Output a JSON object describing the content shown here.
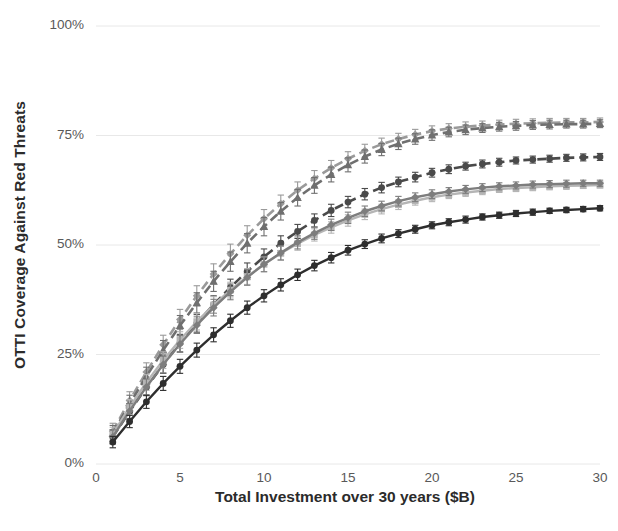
{
  "chart_data": {
    "type": "line",
    "title": "",
    "subtitle": "",
    "xlabel": "Total Investment over 30 years ($B)",
    "ylabel": "OTTI Coverage Against Red Threats",
    "xlim": [
      0,
      30
    ],
    "ylim": [
      0,
      1.0
    ],
    "xticks": [
      0,
      5,
      10,
      15,
      20,
      25,
      30
    ],
    "xtick_labels": [
      "0",
      "5",
      "10",
      "15",
      "20",
      "25",
      "30"
    ],
    "yticks": [
      0,
      0.25,
      0.5,
      0.75,
      1.0
    ],
    "ytick_labels": [
      "0%",
      "25%",
      "50%",
      "75%",
      "100%"
    ],
    "grid": "horizontal",
    "legend": "none",
    "error_bars": true,
    "x": [
      1,
      2,
      3,
      4,
      5,
      6,
      7,
      8,
      9,
      10,
      11,
      12,
      13,
      14,
      15,
      16,
      17,
      18,
      19,
      20,
      21,
      22,
      23,
      24,
      25,
      26,
      27,
      28,
      29,
      30
    ],
    "series": [
      {
        "name": "series-1",
        "color": "#9a9a9a",
        "style": "dashed",
        "marker": "diamond",
        "values": [
          0.075,
          0.145,
          0.21,
          0.272,
          0.33,
          0.384,
          0.434,
          0.48,
          0.522,
          0.56,
          0.594,
          0.625,
          0.652,
          0.676,
          0.697,
          0.715,
          0.73,
          0.742,
          0.752,
          0.76,
          0.766,
          0.77,
          0.773,
          0.775,
          0.777,
          0.778,
          0.779,
          0.78,
          0.78,
          0.781
        ],
        "err": [
          0.018,
          0.02,
          0.021,
          0.022,
          0.023,
          0.023,
          0.023,
          0.022,
          0.022,
          0.021,
          0.02,
          0.019,
          0.018,
          0.017,
          0.016,
          0.015,
          0.014,
          0.013,
          0.012,
          0.012,
          0.011,
          0.011,
          0.01,
          0.01,
          0.01,
          0.01,
          0.01,
          0.009,
          0.009,
          0.009
        ]
      },
      {
        "name": "series-2",
        "color": "#6f6f6f",
        "style": "dashed",
        "marker": "triangle",
        "values": [
          0.07,
          0.137,
          0.2,
          0.26,
          0.316,
          0.368,
          0.417,
          0.462,
          0.504,
          0.542,
          0.577,
          0.608,
          0.636,
          0.661,
          0.683,
          0.702,
          0.718,
          0.731,
          0.742,
          0.751,
          0.758,
          0.763,
          0.767,
          0.77,
          0.772,
          0.774,
          0.775,
          0.776,
          0.776,
          0.777
        ],
        "err": [
          0.018,
          0.02,
          0.021,
          0.022,
          0.023,
          0.023,
          0.023,
          0.022,
          0.022,
          0.021,
          0.02,
          0.019,
          0.018,
          0.017,
          0.016,
          0.015,
          0.014,
          0.013,
          0.012,
          0.012,
          0.011,
          0.011,
          0.01,
          0.01,
          0.01,
          0.01,
          0.01,
          0.009,
          0.009,
          0.009
        ]
      },
      {
        "name": "series-3",
        "color": "#4a4a4a",
        "style": "dashed",
        "marker": "circle",
        "values": [
          0.062,
          0.12,
          0.175,
          0.227,
          0.276,
          0.321,
          0.364,
          0.403,
          0.44,
          0.473,
          0.504,
          0.531,
          0.556,
          0.579,
          0.598,
          0.616,
          0.631,
          0.644,
          0.655,
          0.665,
          0.673,
          0.68,
          0.685,
          0.689,
          0.693,
          0.695,
          0.697,
          0.699,
          0.7,
          0.701
        ],
        "err": [
          0.016,
          0.018,
          0.019,
          0.02,
          0.02,
          0.02,
          0.02,
          0.019,
          0.019,
          0.018,
          0.017,
          0.016,
          0.015,
          0.014,
          0.013,
          0.013,
          0.012,
          0.011,
          0.011,
          0.01,
          0.01,
          0.009,
          0.009,
          0.009,
          0.008,
          0.008,
          0.008,
          0.008,
          0.008,
          0.008
        ]
      },
      {
        "name": "series-4",
        "color": "#b5b5b5",
        "style": "solid",
        "marker": "square",
        "values": [
          0.068,
          0.13,
          0.186,
          0.237,
          0.283,
          0.325,
          0.363,
          0.397,
          0.428,
          0.456,
          0.481,
          0.503,
          0.523,
          0.54,
          0.556,
          0.57,
          0.582,
          0.592,
          0.601,
          0.609,
          0.615,
          0.62,
          0.624,
          0.628,
          0.63,
          0.632,
          0.634,
          0.635,
          0.636,
          0.637
        ],
        "err": [
          0.016,
          0.017,
          0.018,
          0.019,
          0.019,
          0.019,
          0.019,
          0.018,
          0.018,
          0.017,
          0.016,
          0.015,
          0.014,
          0.013,
          0.013,
          0.012,
          0.011,
          0.011,
          0.01,
          0.01,
          0.009,
          0.009,
          0.009,
          0.008,
          0.008,
          0.008,
          0.008,
          0.008,
          0.007,
          0.007
        ]
      },
      {
        "name": "series-5",
        "color": "#7d7d7d",
        "style": "solid",
        "marker": "diamond",
        "values": [
          0.062,
          0.121,
          0.176,
          0.227,
          0.274,
          0.317,
          0.357,
          0.393,
          0.426,
          0.456,
          0.482,
          0.506,
          0.527,
          0.546,
          0.562,
          0.577,
          0.589,
          0.6,
          0.609,
          0.616,
          0.622,
          0.627,
          0.631,
          0.634,
          0.636,
          0.638,
          0.639,
          0.64,
          0.641,
          0.641
        ],
        "err": [
          0.016,
          0.017,
          0.018,
          0.019,
          0.019,
          0.019,
          0.019,
          0.018,
          0.018,
          0.017,
          0.016,
          0.015,
          0.014,
          0.013,
          0.013,
          0.012,
          0.011,
          0.011,
          0.01,
          0.01,
          0.009,
          0.009,
          0.009,
          0.008,
          0.008,
          0.008,
          0.008,
          0.008,
          0.007,
          0.007
        ]
      },
      {
        "name": "series-6",
        "color": "#2e2e2e",
        "style": "solid",
        "marker": "circle",
        "values": [
          0.05,
          0.097,
          0.142,
          0.184,
          0.223,
          0.26,
          0.295,
          0.327,
          0.357,
          0.384,
          0.409,
          0.432,
          0.453,
          0.471,
          0.488,
          0.502,
          0.515,
          0.526,
          0.536,
          0.545,
          0.552,
          0.558,
          0.564,
          0.568,
          0.572,
          0.575,
          0.578,
          0.58,
          0.582,
          0.584
        ],
        "err": [
          0.013,
          0.014,
          0.015,
          0.016,
          0.016,
          0.016,
          0.016,
          0.015,
          0.015,
          0.014,
          0.014,
          0.013,
          0.012,
          0.012,
          0.011,
          0.01,
          0.01,
          0.009,
          0.009,
          0.008,
          0.008,
          0.008,
          0.007,
          0.007,
          0.007,
          0.007,
          0.006,
          0.006,
          0.006,
          0.006
        ]
      }
    ]
  },
  "colors": {
    "grid": "#e8e8e8",
    "tick_text": "#595959",
    "axis_title": "#2b2b2b",
    "background": "#ffffff"
  }
}
